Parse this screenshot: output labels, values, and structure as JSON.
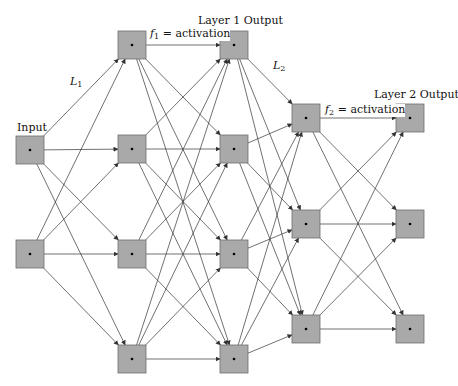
{
  "diagram": {
    "type": "neural-network",
    "colors": {
      "node_fill": "#a9a9a9",
      "node_stroke": "#6e6e6e",
      "edge": "#333333",
      "dot": "#000000"
    },
    "layers": [
      {
        "id": "input",
        "label": "Input",
        "x": 16,
        "nodes_y": [
          136,
          240
        ]
      },
      {
        "id": "layer1_in",
        "label": "",
        "x": 118,
        "nodes_y": [
          31,
          135,
          240,
          345
        ]
      },
      {
        "id": "layer1_out",
        "label": "Layer 1 Output",
        "x": 220,
        "nodes_y": [
          31,
          135,
          240,
          345
        ]
      },
      {
        "id": "layer2_in",
        "label": "",
        "x": 292,
        "nodes_y": [
          104,
          210,
          315
        ]
      },
      {
        "id": "layer2_out",
        "label": "Layer 2 Output",
        "x": 396,
        "nodes_y": [
          104,
          210,
          315
        ]
      }
    ],
    "node_size": 28,
    "connections": [
      {
        "from": "input",
        "to": "layer1_in",
        "type": "full",
        "label": "L1"
      },
      {
        "from": "layer1_in",
        "to": "layer1_out",
        "type": "one-to-one-plus-full",
        "label": "f1 = activation"
      },
      {
        "from": "layer1_out",
        "to": "layer2_in",
        "type": "full",
        "label": "L2"
      },
      {
        "from": "layer2_in",
        "to": "layer2_out",
        "type": "full",
        "label": "f2 = activation"
      }
    ]
  },
  "labels": {
    "input": "Input",
    "layer1_output": "Layer 1 Output",
    "layer2_output": "Layer 2 Output",
    "L1_main": "L",
    "L1_sub": "1",
    "L2_main": "L",
    "L2_sub": "2",
    "f1_main": "f",
    "f1_sub": "1",
    "f1_rest": " = activation",
    "f2_main": "f",
    "f2_sub": "2",
    "f2_rest": " = activation"
  }
}
